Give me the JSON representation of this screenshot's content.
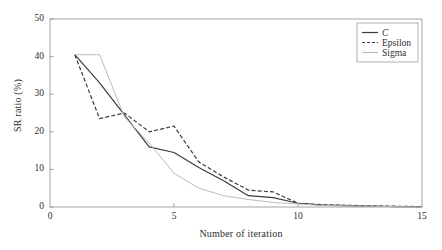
{
  "chart_data": {
    "type": "line",
    "title": "",
    "xlabel": "Number of iteration",
    "ylabel": "SR ratio (%)",
    "xlim": [
      0,
      15
    ],
    "ylim": [
      0,
      50
    ],
    "xticks": [
      0,
      5,
      10,
      15
    ],
    "xtick_labels": [
      "0",
      "5",
      "10",
      "15"
    ],
    "yticks": [
      0,
      10,
      20,
      30,
      40,
      50
    ],
    "ytick_labels": [
      "0",
      "10",
      "20",
      "30",
      "40",
      "50"
    ],
    "grid": false,
    "legend_position": "top-right",
    "x": [
      1,
      2,
      3,
      4,
      5,
      6,
      7,
      8,
      9,
      10,
      11,
      12,
      13,
      14,
      15
    ],
    "series": [
      {
        "name": "C",
        "style": "solid",
        "color": "#3c3c3c",
        "values": [
          40.5,
          33.0,
          24.5,
          16.0,
          14.5,
          10.5,
          7.0,
          3.0,
          2.5,
          1.0,
          0.5,
          0.35,
          0.2,
          0.12,
          0.1
        ]
      },
      {
        "name": "Epsilon",
        "style": "dashed",
        "color": "#3c3c3c",
        "values": [
          40.5,
          23.5,
          25.0,
          20.0,
          21.5,
          12.0,
          8.0,
          4.5,
          4.0,
          1.0,
          0.6,
          0.45,
          0.3,
          0.2,
          0.1
        ]
      },
      {
        "name": "Sigma",
        "style": "solid",
        "color": "#bcbcbc",
        "values": [
          40.5,
          40.5,
          24.0,
          17.0,
          9.0,
          5.0,
          3.0,
          2.0,
          1.2,
          0.8,
          0.4,
          0.3,
          0.2,
          0.1,
          0.0
        ]
      }
    ]
  },
  "legend": {
    "entries": [
      {
        "label": "C"
      },
      {
        "label": "Epsilon"
      },
      {
        "label": "Sigma"
      }
    ]
  },
  "axes": {
    "xlabel": "Number of iteration",
    "ylabel": "SR ratio (%)"
  }
}
